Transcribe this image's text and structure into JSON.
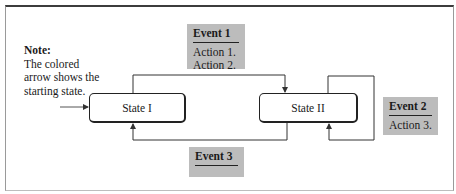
{
  "diagram": {
    "type": "state-transition",
    "note": {
      "heading": "Note:",
      "lines": [
        "The colored",
        "arrow shows the",
        "starting state."
      ]
    },
    "states": [
      {
        "id": "state-1",
        "label": "State I",
        "initial": true
      },
      {
        "id": "state-2",
        "label": "State II",
        "initial": false
      }
    ],
    "events": [
      {
        "id": "event-1",
        "name": "Event 1",
        "actions": [
          "Action 1.",
          "Action 2."
        ],
        "from": "State I",
        "to": "State II"
      },
      {
        "id": "event-2",
        "name": "Event 2",
        "actions": [
          "Action 3."
        ],
        "from": "State II",
        "to": "State II"
      },
      {
        "id": "event-3",
        "name": "Event 3",
        "actions": [],
        "from": "State II",
        "to": "State I"
      }
    ],
    "colors": {
      "event_box": "#bcbcbc",
      "line": "#333333",
      "frame_top": "#3c3c3c"
    }
  }
}
